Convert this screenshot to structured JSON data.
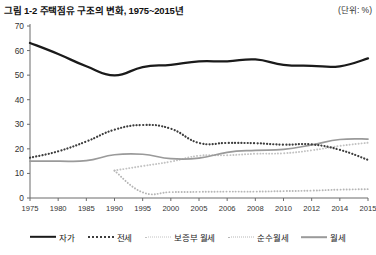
{
  "header": {
    "title": "그림 1-2 주택점유 구조의 변화, 1975~2015년",
    "unit": "(단위: %)"
  },
  "legend": {
    "items": [
      {
        "label": "자가",
        "style": "solid-black",
        "color": "#1a1a1a"
      },
      {
        "label": "전세",
        "style": "dotted-dark",
        "color": "#3d3d3d"
      },
      {
        "label": "보증부 월세",
        "style": "dotted-light",
        "color": "#c2c2c2"
      },
      {
        "label": "순수월세",
        "style": "dotted-light2",
        "color": "#b6b6b6"
      },
      {
        "label": "월세",
        "style": "solid-gray",
        "color": "#9a9a9a"
      }
    ]
  },
  "chart_data": {
    "type": "line",
    "title": "그림 1-2 주택점유 구조의 변화, 1975~2015년",
    "subtitle": "",
    "xlabel": "",
    "ylabel": "",
    "unit": "(단위: %)",
    "grid": false,
    "legend_position": "bottom",
    "ylim": [
      0,
      70
    ],
    "yticks": [
      0,
      10,
      20,
      30,
      40,
      50,
      60,
      70
    ],
    "categories": [
      "1975",
      "1980",
      "1985",
      "1990",
      "1995",
      "2000",
      "2005",
      "2006",
      "2008",
      "2010",
      "2012",
      "2014",
      "2015"
    ],
    "series": [
      {
        "name": "자가",
        "style": "solid-black",
        "color": "#1a1a1a",
        "values": [
          63.1,
          58.6,
          53.6,
          49.9,
          53.3,
          54.2,
          55.6,
          55.6,
          56.4,
          54.2,
          53.8,
          53.6,
          56.8
        ]
      },
      {
        "name": "전세",
        "style": "dotted-dark",
        "color": "#3d3d3d",
        "values": [
          16.4,
          19.0,
          23.0,
          27.8,
          29.7,
          28.2,
          22.4,
          22.4,
          22.3,
          21.7,
          21.8,
          19.6,
          15.5
        ]
      },
      {
        "name": "보증부 월세",
        "style": "dotted-light",
        "color": "#c2c2c2",
        "values": [
          null,
          null,
          null,
          11.2,
          13.0,
          14.8,
          17.2,
          17.4,
          18.0,
          18.2,
          19.4,
          21.2,
          22.5
        ]
      },
      {
        "name": "순수월세",
        "style": "dotted-light2",
        "color": "#b6b6b6",
        "values": [
          null,
          null,
          null,
          11.1,
          2.3,
          2.4,
          2.5,
          2.6,
          2.6,
          2.8,
          3.0,
          3.4,
          3.6
        ]
      },
      {
        "name": "월세",
        "style": "solid-gray",
        "color": "#9a9a9a",
        "values": [
          15.0,
          15.0,
          15.2,
          17.6,
          17.8,
          16.0,
          16.2,
          18.6,
          19.4,
          19.8,
          21.6,
          23.8,
          24.0
        ]
      }
    ]
  }
}
